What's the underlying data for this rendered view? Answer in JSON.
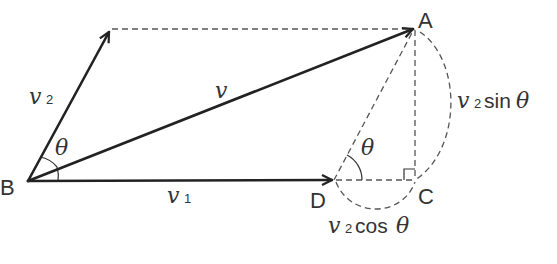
{
  "diagram": {
    "points": {
      "A": "A",
      "B": "B",
      "C": "C",
      "D": "D"
    },
    "vectors": {
      "v": {
        "symbol": "v",
        "subscript": ""
      },
      "v1": {
        "symbol": "v",
        "subscript": "1"
      },
      "v2": {
        "symbol": "v",
        "subscript": "2"
      }
    },
    "angles": {
      "at_B": "θ",
      "at_D": "θ"
    },
    "components": {
      "vertical": {
        "symbol": "v",
        "subscript": "2",
        "func": "sin",
        "angle": "θ"
      },
      "horizontal": {
        "symbol": "v",
        "subscript": "2",
        "func": "cos",
        "angle": "θ"
      }
    },
    "colors": {
      "line": "#222222",
      "dashed": "#555555",
      "text": "#333333"
    }
  }
}
